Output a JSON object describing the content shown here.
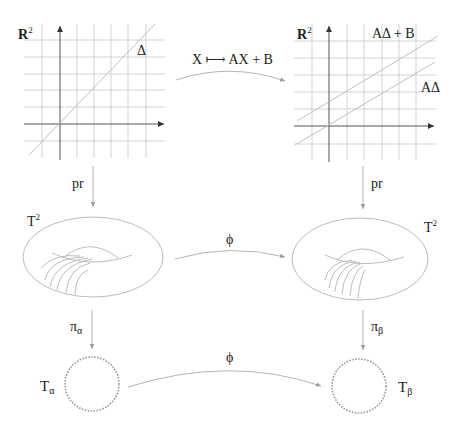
{
  "diagram": {
    "top_left": {
      "space_label": "R",
      "space_sup": "2",
      "line_label": "Δ"
    },
    "top_right": {
      "space_label": "R",
      "space_sup": "2",
      "line_upper_label": "AΔ + B",
      "line_lower_label": "AΔ"
    },
    "top_arrow_label": "X ⟼ AX + B",
    "left_down_arrow_1": "pr",
    "right_down_arrow_1": "pr",
    "middle_left": {
      "label": "T",
      "sup": "2"
    },
    "middle_right": {
      "label": "T",
      "sup": "2"
    },
    "middle_arrow_label": "ϕ",
    "left_down_arrow_2": {
      "label": "π",
      "sub": "α"
    },
    "right_down_arrow_2": {
      "label": "π",
      "sub": "β"
    },
    "bottom_left": {
      "label": "T",
      "sub": "α"
    },
    "bottom_right": {
      "label": "T",
      "sub": "β"
    },
    "bottom_arrow_label": "ϕ",
    "colors": {
      "axis": "#555555",
      "grid": "#c8c8c8",
      "curve": "#bdbdbd",
      "text": "#222222"
    }
  }
}
